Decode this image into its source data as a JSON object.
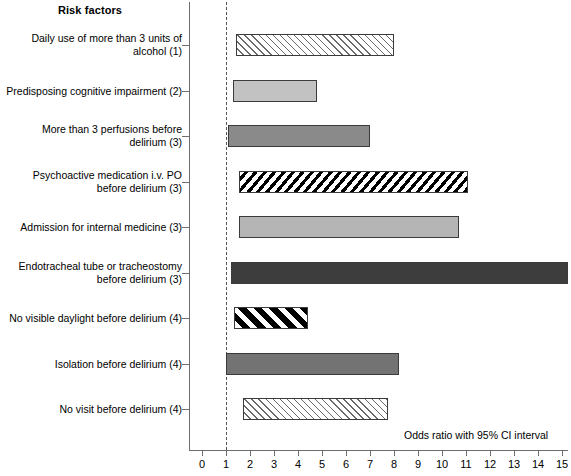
{
  "header": {
    "risk_factors_title": "Risk factors"
  },
  "annotation": {
    "axis_note": "Odds ratio with 95% CI interval"
  },
  "chart_data": {
    "type": "bar",
    "orientation": "horizontal",
    "title": "Risk factors",
    "xlabel": "Odds ratio with 95% CI interval",
    "ylabel": "Risk factors",
    "xlim": [
      0,
      15.6
    ],
    "xticks": [
      0,
      1,
      2,
      3,
      4,
      5,
      6,
      7,
      8,
      9,
      10,
      11,
      12,
      13,
      14,
      15
    ],
    "xtick_labels": [
      "0",
      "1",
      "2",
      "3",
      "4",
      "5",
      "6",
      "7",
      "8",
      "9",
      "10",
      "11",
      "12",
      "13",
      "14",
      "15"
    ],
    "grid": false,
    "legend": false,
    "reference_line": 1,
    "categories": [
      "Daily use of more than 3 units of alcohol (1)",
      "Predisposing cognitive impairment (2)",
      "More than 3 perfusions before delirium (3)",
      "Psychoactive medication i.v. PO before delirium (3)",
      "Admission for internal medicine (3)",
      "Endotracheal tube or tracheostomy before delirium (3)",
      "No visible daylight before delirium (4)",
      "Isolation before delirium (4)",
      "No visit before delirium (4)"
    ],
    "bars": [
      {
        "label_line1": "Daily use of more than 3 units of",
        "label_line2": "alcohol (1)",
        "ci_low": 1.4,
        "ci_high": 8.0,
        "fill": "hatch-light"
      },
      {
        "label_line1": "Predisposing cognitive impairment (2)",
        "label_line2": "",
        "ci_low": 1.3,
        "ci_high": 4.8,
        "fill": "solid-lightgray"
      },
      {
        "label_line1": "More than 3 perfusions before",
        "label_line2": "delirium (3)",
        "ci_low": 1.1,
        "ci_high": 7.0,
        "fill": "solid-midgray"
      },
      {
        "label_line1": "Psychoactive medication i.v. PO",
        "label_line2": "before delirium (3)",
        "ci_low": 1.55,
        "ci_high": 11.1,
        "fill": "dots-dense"
      },
      {
        "label_line1": "Admission for internal medicine (3)",
        "label_line2": "",
        "ci_low": 1.55,
        "ci_high": 10.7,
        "fill": "solid-lightgray2"
      },
      {
        "label_line1": "Endotracheal tube or tracheostomy",
        "label_line2": "before delirium (3)",
        "ci_low": 1.2,
        "ci_high": 15.25,
        "fill": "solid-dark"
      },
      {
        "label_line1": "No visible daylight before delirium (4)",
        "label_line2": "",
        "ci_low": 1.35,
        "ci_high": 4.4,
        "fill": "hatch-bold"
      },
      {
        "label_line1": "Isolation before delirium (4)",
        "label_line2": "",
        "ci_low": 1.0,
        "ci_high": 8.2,
        "fill": "solid-gray"
      },
      {
        "label_line1": "No visit before delirium (4)",
        "label_line2": "",
        "ci_low": 1.7,
        "ci_high": 7.75,
        "fill": "hatch-light"
      }
    ]
  },
  "colors": {
    "axis": "#6e6e6e",
    "reference_line": "#555555",
    "bar_border": "#3b3b3b",
    "bar_light": "#c2c2c2",
    "bar_mid": "#8a8a8a",
    "bar_dark": "#3d3d3d"
  }
}
